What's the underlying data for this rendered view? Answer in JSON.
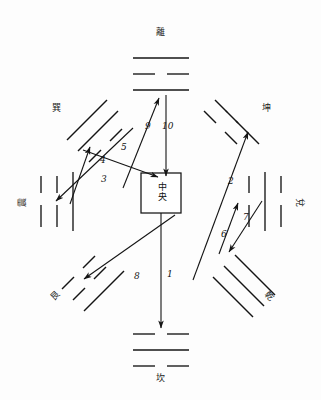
{
  "diagram": {
    "ink_color": "#141414",
    "background_color": "#fdfdfd",
    "center": {
      "label": "中央",
      "char_1": "中",
      "char_2": "央"
    },
    "trigrams": [
      {
        "id": "li",
        "label": "離",
        "position": "top",
        "lines": "solid,broken,solid",
        "orientation": "horizontal"
      },
      {
        "id": "kan",
        "label": "坎",
        "position": "bottom",
        "lines": "broken,solid,broken",
        "orientation": "horizontal"
      },
      {
        "id": "zhen",
        "label": "震",
        "position": "left",
        "lines": "broken,broken,solid",
        "orientation": "vertical"
      },
      {
        "id": "dui",
        "label": "兌",
        "position": "right",
        "lines": "broken,solid,broken",
        "orientation": "vertical"
      },
      {
        "id": "xun",
        "label": "巽",
        "position": "top-left",
        "lines": "solid,solid,broken",
        "orientation": "diagonal"
      },
      {
        "id": "kun",
        "label": "坤",
        "position": "top-right",
        "lines": "broken,broken,broken",
        "orientation": "diagonal"
      },
      {
        "id": "gen",
        "label": "艮",
        "position": "bottom-left",
        "lines": "broken,broken,solid",
        "orientation": "diagonal"
      },
      {
        "id": "qian",
        "label": "乾",
        "position": "bottom-right",
        "lines": "solid,solid,solid",
        "orientation": "diagonal"
      }
    ],
    "arrows": [
      {
        "number": "1",
        "from": "center",
        "to": "kan",
        "label_x": 167,
        "label_y": 270
      },
      {
        "number": "2",
        "from": "qian",
        "to": "kun",
        "label_x": 228,
        "label_y": 177
      },
      {
        "number": "3",
        "from": "xun",
        "to": "zhen",
        "label_x": 101,
        "label_y": 175
      },
      {
        "number": "4",
        "from": "zhen",
        "to": "xun",
        "label_x": 100,
        "label_y": 156
      },
      {
        "number": "5",
        "from": "xun",
        "to": "center",
        "label_x": 121,
        "label_y": 143
      },
      {
        "number": "6",
        "from": "dui",
        "to": "qian",
        "label_x": 221,
        "label_y": 230
      },
      {
        "number": "7",
        "from": "qian",
        "to": "dui",
        "label_x": 243,
        "label_y": 213
      },
      {
        "number": "8",
        "from": "center",
        "to": "gen",
        "label_x": 134,
        "label_y": 272
      },
      {
        "number": "9",
        "from": "center",
        "to": "li",
        "label_x": 145,
        "label_y": 122
      },
      {
        "number": "10",
        "from": "li",
        "to": "center",
        "label_x": 162,
        "label_y": 122
      }
    ]
  }
}
